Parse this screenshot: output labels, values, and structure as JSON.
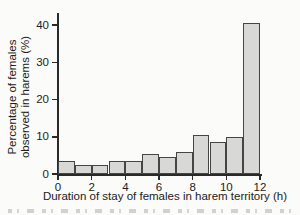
{
  "chart_data": {
    "type": "bar",
    "title": "",
    "xlabel": "Duration of stay of females in harem territory (h)",
    "ylabel": "Percentage of females observed in harems (%)",
    "ylabel_lines": [
      "Percentage of females",
      "observed in harems (%)"
    ],
    "bin_width_h": 1,
    "bin_edges": [
      0,
      1,
      2,
      3,
      4,
      5,
      6,
      7,
      8,
      9,
      10,
      11,
      12
    ],
    "categories": [
      "0-1",
      "1-2",
      "2-3",
      "3-4",
      "4-5",
      "5-6",
      "6-7",
      "7-8",
      "8-9",
      "9-10",
      "10-11",
      "11-12"
    ],
    "values": [
      3.5,
      2.5,
      2.5,
      3.5,
      3.5,
      5.5,
      4.5,
      6,
      10.5,
      8.5,
      10,
      40.5
    ],
    "x_ticks": [
      0,
      2,
      4,
      6,
      8,
      10,
      12
    ],
    "y_ticks": [
      0,
      10,
      20,
      30,
      40
    ],
    "xlim": [
      0,
      12
    ],
    "ylim": [
      0,
      43
    ],
    "grid": "off",
    "legend": "none",
    "colors": {
      "bar_fill": "#d8d8d6",
      "bar_border": "#454545",
      "axis": "#2a2a2a",
      "text": "#222222",
      "background": "#fbfbf9"
    }
  }
}
